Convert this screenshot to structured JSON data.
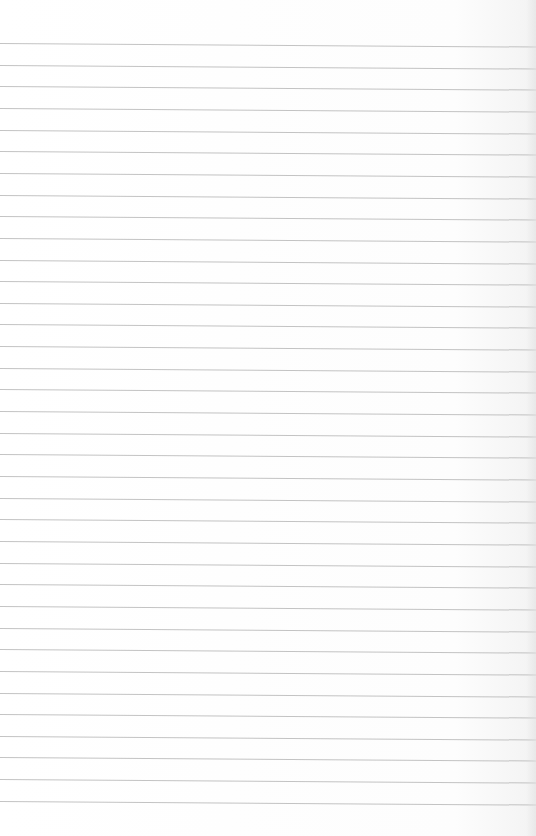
{
  "page": {
    "type": "lined-paper",
    "background_color": "#fefefe",
    "rule_color": "#b9b9b9",
    "rule_count": 36,
    "first_rule_y": 43,
    "rule_spacing": 21.65,
    "text": []
  }
}
